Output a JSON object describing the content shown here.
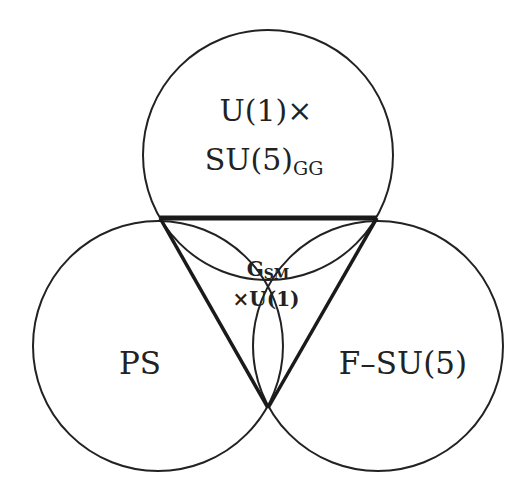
{
  "diagram": {
    "type": "venn-with-triangle",
    "sets": [
      {
        "id": "top",
        "label_line1": "U(1)×",
        "label_line2_main": "SU(5)",
        "label_line2_sub": "GG"
      },
      {
        "id": "left",
        "label": "PS"
      },
      {
        "id": "right",
        "label": "F–SU(5)"
      }
    ],
    "center": {
      "line1_main": "G",
      "line1_sub": "SM",
      "line2": "×U(1)"
    },
    "colors": {
      "stroke": "#222222",
      "background": "#ffffff"
    }
  }
}
